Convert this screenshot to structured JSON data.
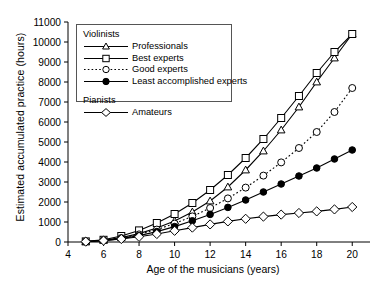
{
  "chart_data": {
    "type": "line",
    "title": "",
    "xlabel": "Age of the musicians (years)",
    "ylabel": "Estimated accumulated practice (hours)",
    "xlim": [
      4,
      21
    ],
    "ylim": [
      0,
      11000
    ],
    "xticks": [
      4,
      6,
      8,
      10,
      12,
      14,
      16,
      18,
      20
    ],
    "yticks": [
      0,
      1000,
      2000,
      3000,
      4000,
      5000,
      6000,
      7000,
      8000,
      9000,
      10000,
      11000
    ],
    "grid": false,
    "legend_position": "upper left",
    "x": [
      5,
      6,
      7,
      8,
      9,
      10,
      11,
      12,
      13,
      14,
      15,
      16,
      17,
      18,
      19,
      20
    ],
    "series": [
      {
        "name": "Professionals",
        "group": "Violinists",
        "marker": "triangle-open",
        "linestyle": "solid",
        "values": [
          20,
          90,
          220,
          420,
          700,
          1050,
          1500,
          2050,
          2750,
          3600,
          4550,
          5600,
          6750,
          8000,
          9200,
          10400
        ]
      },
      {
        "name": "Best experts",
        "group": "Violinists",
        "marker": "square-open",
        "linestyle": "solid",
        "values": [
          30,
          110,
          300,
          580,
          950,
          1400,
          1950,
          2600,
          3350,
          4200,
          5150,
          6200,
          7300,
          8450,
          9500,
          10400
        ]
      },
      {
        "name": "Good experts",
        "group": "Violinists",
        "marker": "circle-open",
        "linestyle": "dotted",
        "values": [
          20,
          80,
          200,
          380,
          620,
          920,
          1280,
          1700,
          2180,
          2720,
          3320,
          3980,
          4700,
          5500,
          6500,
          7700
        ]
      },
      {
        "name": "Least accomplished experts",
        "group": "Violinists",
        "marker": "circle-filled",
        "linestyle": "solid",
        "values": [
          15,
          70,
          170,
          320,
          520,
          770,
          1060,
          1380,
          1730,
          2100,
          2500,
          2900,
          3300,
          3700,
          4150,
          4600
        ]
      },
      {
        "name": "Amateurs",
        "group": "Pianists",
        "marker": "diamond-open",
        "linestyle": "solid",
        "values": [
          20,
          70,
          150,
          260,
          400,
          560,
          720,
          880,
          1030,
          1160,
          1270,
          1370,
          1450,
          1530,
          1630,
          1750
        ]
      }
    ]
  },
  "legend": {
    "groups": [
      {
        "heading": "Violinists",
        "entries": [
          {
            "label": "Professionals"
          },
          {
            "label": "Best experts"
          },
          {
            "label": "Good experts"
          },
          {
            "label": "Least accomplished experts"
          }
        ]
      },
      {
        "heading": "Pianists",
        "entries": [
          {
            "label": "Amateurs"
          }
        ]
      }
    ]
  }
}
